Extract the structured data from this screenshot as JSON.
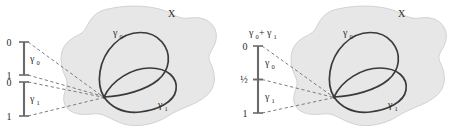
{
  "figure": {
    "colors": {
      "blob_fill": "#e7e7e7",
      "blob_stroke": "#cfcfcf",
      "curve_stroke": "#3a3a3a",
      "dashed_stroke": "#6e6e6e",
      "axis_stroke": "#6a6a6a",
      "text": "#2b2b2b",
      "background": "#ffffff"
    }
  },
  "panels": [
    {
      "id": "left",
      "name": "separate-intervals-panel",
      "space_label": "X",
      "loop_labels": {
        "outer": "γ",
        "outer_sub": "0",
        "inner": "γ",
        "inner_sub": "1"
      },
      "intervals": [
        {
          "name": "interval-gamma-0",
          "segment_label": "γ",
          "segment_label_sub": "0",
          "ticks": [
            {
              "value": "0",
              "position": 0
            },
            {
              "value": "1",
              "position": 1
            }
          ]
        },
        {
          "name": "interval-gamma-1",
          "segment_label": "γ",
          "segment_label_sub": "1",
          "ticks": [
            {
              "value": "0",
              "position": 0
            },
            {
              "value": "1",
              "position": 1
            }
          ]
        }
      ],
      "dashed_line_count": 4
    },
    {
      "id": "right",
      "name": "concatenated-interval-panel",
      "space_label": "X",
      "loop_labels": {
        "outer": "γ",
        "outer_sub": "0",
        "inner": "γ",
        "inner_sub": "1"
      },
      "axis_title": {
        "lead": "γ",
        "lead_sub": "0",
        "op": "+",
        "trail": "γ",
        "trail_sub": "1"
      },
      "intervals": [
        {
          "name": "interval-gamma-0-plus-gamma-1",
          "segments": [
            {
              "label": "γ",
              "label_sub": "0"
            },
            {
              "label": "γ",
              "label_sub": "1"
            }
          ],
          "ticks": [
            {
              "value": "0",
              "position": 0
            },
            {
              "value": "½",
              "position": 0.5
            },
            {
              "value": "1",
              "position": 1
            }
          ]
        }
      ],
      "dashed_line_count": 3
    }
  ]
}
